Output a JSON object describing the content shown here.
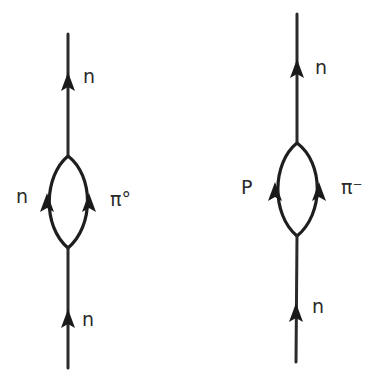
{
  "diagrams": [
    {
      "name": "neutron-self-energy-neutral-pion",
      "labels": {
        "outgoing": "n",
        "loop_left": "n",
        "loop_right": "π°",
        "incoming": "n"
      }
    },
    {
      "name": "neutron-self-energy-charged-pion",
      "labels": {
        "outgoing": "n",
        "loop_left": "P",
        "loop_right": "π⁻",
        "incoming": "n"
      }
    }
  ],
  "colors": {
    "ink": "#1e1e1e",
    "background": "#ffffff"
  }
}
